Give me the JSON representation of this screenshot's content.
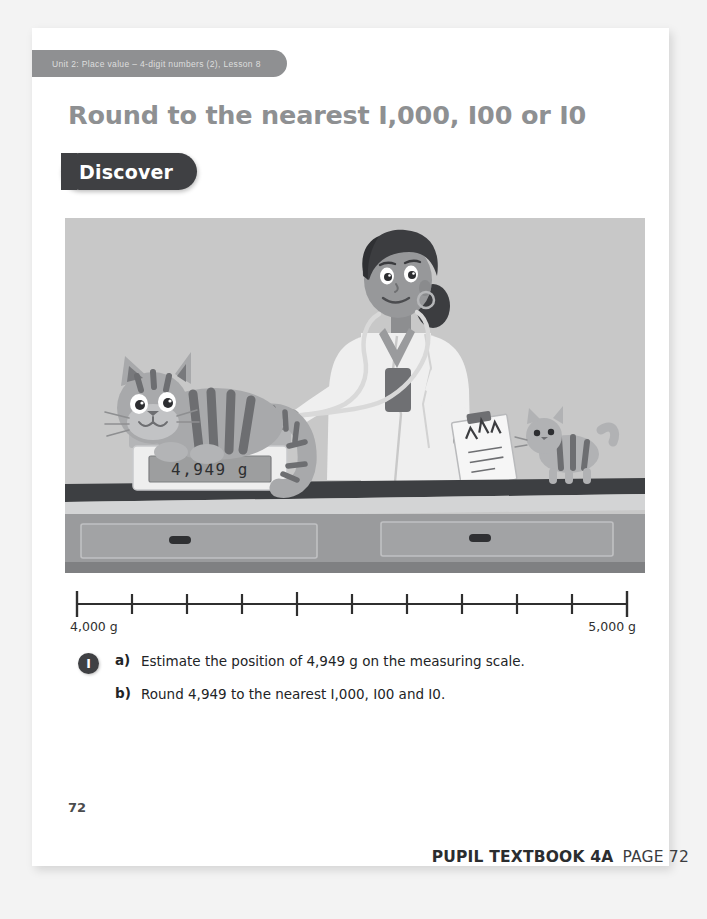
{
  "page": {
    "unit_tab": "Unit 2: Place value – 4-digit numbers (2), Lesson 8",
    "title": "Round to the nearest I,000, I00 or I0",
    "section_badge": "Discover",
    "page_number": "72"
  },
  "illustration": {
    "alt_name": "vet-weighing-cat-scene",
    "scale_reading": "4,949",
    "scale_unit": "g",
    "wall_color": "#c7c7c7",
    "counter_top_color": "#3d3f42",
    "counter_front_color": "#9a9b9d",
    "coat_color": "#f2f2f2",
    "cat_color": "#a9aaac",
    "cat_stripe_color": "#6c6d70",
    "skin_color": "#8c8d8f",
    "hair_color": "#3a3b3e"
  },
  "number_line": {
    "left_label": "4,000 g",
    "right_label": "5,000 g",
    "tick_count": 11,
    "start_value": 4000,
    "end_value": 5000,
    "line_color": "#2f2f2f"
  },
  "questions": {
    "number_badge": "I",
    "items": [
      {
        "letter": "a)",
        "text": "Estimate the position of 4,949 g on the measuring scale."
      },
      {
        "letter": "b)",
        "text": "Round 4,949 to the nearest I,000, I00 and I0."
      }
    ]
  },
  "footer": {
    "book": "PUPIL TEXTBOOK 4A",
    "page": "PAGE 72"
  }
}
